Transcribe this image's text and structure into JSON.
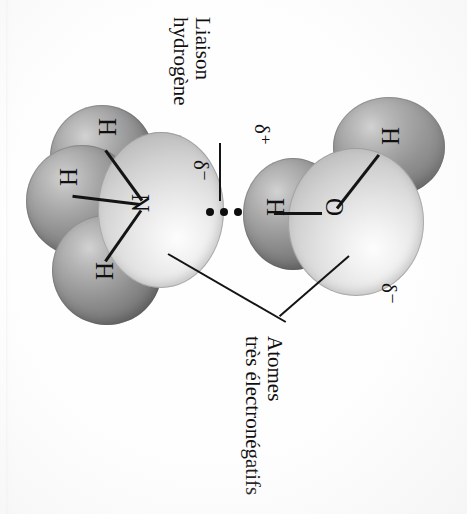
{
  "figure": {
    "kind": "chemistry-space-filling-diagram",
    "background_color": "#fefefe",
    "text_color": "#101010",
    "text_rotation_degrees": 90
  },
  "callouts": {
    "hydrogen_bond": {
      "line1": "Liaison",
      "line2": "hydrogène"
    },
    "electronegative_atoms": {
      "line1": "Atomes",
      "line2": "très électronégatifs"
    }
  },
  "charges": {
    "nitrogen_partial": "δ⁻",
    "hydrogen_partial": "δ⁺",
    "oxygen_partial": "δ⁻"
  },
  "molecules": [
    {
      "name": "ammonia",
      "formula": "NH3",
      "atoms": [
        {
          "element": "N",
          "label": "N",
          "role": "central",
          "shade": "pale"
        },
        {
          "element": "H",
          "label": "H",
          "role": "terminal",
          "shade": "dark"
        },
        {
          "element": "H",
          "label": "H",
          "role": "terminal",
          "shade": "dark"
        },
        {
          "element": "H",
          "label": "H",
          "role": "terminal",
          "shade": "dark"
        }
      ]
    },
    {
      "name": "water",
      "formula": "H2O",
      "atoms": [
        {
          "element": "O",
          "label": "O",
          "role": "central",
          "shade": "pale"
        },
        {
          "element": "H",
          "label": "H",
          "role": "terminal",
          "shade": "dark"
        },
        {
          "element": "H",
          "label": "H",
          "role": "terminal",
          "shade": "dark"
        }
      ]
    }
  ],
  "hydrogen_bond": {
    "representation": "three-dots",
    "dot_count": 3,
    "donor": "H (water)",
    "acceptor": "N (ammonia)"
  },
  "atom_labels": {
    "ammonia_n": "N",
    "ammonia_h_top": "H",
    "ammonia_h_left": "H",
    "ammonia_h_bottom": "H",
    "water_o": "O",
    "water_h_upper": "H",
    "water_h_lower": "H"
  },
  "colors": {
    "pale_atom": "#e2e2e2",
    "dark_atom": "#8e8e8e",
    "line": "#141414"
  }
}
